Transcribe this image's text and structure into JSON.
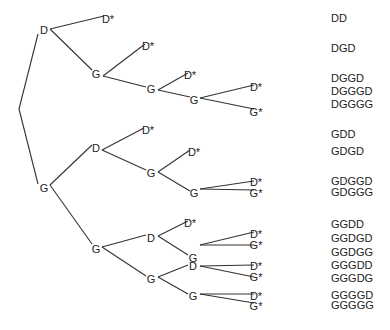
{
  "diagram": {
    "title": "",
    "type": "decision-tree",
    "root": {
      "x": 19,
      "y": 109
    },
    "nodes": [
      {
        "id": "n_D",
        "label": "D",
        "x": 44,
        "y": 30
      },
      {
        "id": "n_DD",
        "label": "D*",
        "x": 108,
        "y": 19
      },
      {
        "id": "n_DG",
        "label": "G",
        "x": 96,
        "y": 74
      },
      {
        "id": "n_DGD",
        "label": "D*",
        "x": 148,
        "y": 46
      },
      {
        "id": "n_DGG",
        "label": "G",
        "x": 151,
        "y": 89
      },
      {
        "id": "n_DGGD",
        "label": "D*",
        "x": 190,
        "y": 75
      },
      {
        "id": "n_DGGG",
        "label": "G",
        "x": 194,
        "y": 100
      },
      {
        "id": "n_DGGGD",
        "label": "D*",
        "x": 256,
        "y": 87
      },
      {
        "id": "n_DGGGG",
        "label": "G*",
        "x": 256,
        "y": 112
      },
      {
        "id": "n_G",
        "label": "G",
        "x": 44,
        "y": 188
      },
      {
        "id": "n_GD",
        "label": "D",
        "x": 96,
        "y": 148
      },
      {
        "id": "n_GDD",
        "label": "D*",
        "x": 148,
        "y": 130
      },
      {
        "id": "n_GDG",
        "label": "G",
        "x": 151,
        "y": 173
      },
      {
        "id": "n_GDGD",
        "label": "D*",
        "x": 194,
        "y": 152
      },
      {
        "id": "n_GDGG",
        "label": "G",
        "x": 194,
        "y": 193
      },
      {
        "id": "n_GDGGD",
        "label": "D*",
        "x": 256,
        "y": 182
      },
      {
        "id": "n_GDGGG",
        "label": "G*",
        "x": 256,
        "y": 193
      },
      {
        "id": "n_GG",
        "label": "G",
        "x": 96,
        "y": 249
      },
      {
        "id": "n_GGD",
        "label": "D",
        "x": 151,
        "y": 238
      },
      {
        "id": "n_GGDD",
        "label": "D*",
        "x": 190,
        "y": 223
      },
      {
        "id": "n_GGDG",
        "label": "G",
        "x": 193,
        "y": 258
      },
      {
        "id": "n_GGDGD",
        "label": "D*",
        "x": 256,
        "y": 234
      },
      {
        "id": "n_GGDGG",
        "label": "G*",
        "x": 256,
        "y": 245
      },
      {
        "id": "n_GGG",
        "label": "G",
        "x": 151,
        "y": 279
      },
      {
        "id": "n_GGGD",
        "label": "D",
        "x": 193,
        "y": 266
      },
      {
        "id": "n_GGGDD",
        "label": "D*",
        "x": 256,
        "y": 266
      },
      {
        "id": "n_GGGDG",
        "label": "G*",
        "x": 256,
        "y": 277
      },
      {
        "id": "n_GGGG",
        "label": "G",
        "x": 193,
        "y": 296
      },
      {
        "id": "n_GGGGD",
        "label": "D*",
        "x": 256,
        "y": 296
      },
      {
        "id": "n_GGGGG",
        "label": "G*",
        "x": 256,
        "y": 306
      }
    ],
    "edges": [
      [
        19,
        109,
        38,
        34
      ],
      [
        19,
        109,
        38,
        184
      ],
      [
        50,
        29,
        104,
        16
      ],
      [
        50,
        29,
        92,
        70
      ],
      [
        103,
        76,
        145,
        44
      ],
      [
        103,
        76,
        146,
        87
      ],
      [
        158,
        90,
        188,
        73
      ],
      [
        158,
        90,
        190,
        97
      ],
      [
        200,
        98,
        254,
        85
      ],
      [
        200,
        98,
        254,
        109
      ],
      [
        50,
        185,
        92,
        145
      ],
      [
        50,
        185,
        92,
        244
      ],
      [
        102,
        150,
        144,
        128
      ],
      [
        102,
        150,
        146,
        170
      ],
      [
        158,
        172,
        190,
        150
      ],
      [
        158,
        172,
        190,
        191
      ],
      [
        200,
        189,
        254,
        181
      ],
      [
        200,
        189,
        254,
        190
      ],
      [
        102,
        247,
        146,
        235
      ],
      [
        102,
        247,
        146,
        276
      ],
      [
        158,
        236,
        188,
        221
      ],
      [
        158,
        236,
        188,
        255
      ],
      [
        200,
        245,
        254,
        232
      ],
      [
        200,
        245,
        254,
        245
      ],
      [
        158,
        277,
        188,
        265
      ],
      [
        158,
        277,
        188,
        294
      ],
      [
        200,
        266,
        254,
        265
      ],
      [
        200,
        266,
        254,
        277
      ],
      [
        200,
        294,
        254,
        294
      ],
      [
        200,
        294,
        254,
        303
      ]
    ],
    "sequences": [
      {
        "label": "DD",
        "y": 13
      },
      {
        "label": "DGD",
        "y": 43
      },
      {
        "label": "DGGD",
        "y": 73
      },
      {
        "label": "DGGGD",
        "y": 86
      },
      {
        "label": "DGGGG",
        "y": 99
      },
      {
        "label": "GDD",
        "y": 129
      },
      {
        "label": "GDGD",
        "y": 146
      },
      {
        "label": "GDGGD",
        "y": 176
      },
      {
        "label": "GDGGG",
        "y": 187
      },
      {
        "label": "GGDD",
        "y": 219
      },
      {
        "label": "GGDGD",
        "y": 233
      },
      {
        "label": "GGDGG",
        "y": 247
      },
      {
        "label": "GGGDD",
        "y": 260
      },
      {
        "label": "GGGDG",
        "y": 273
      },
      {
        "label": "GGGGD",
        "y": 290
      },
      {
        "label": "GGGGG",
        "y": 300
      }
    ]
  }
}
